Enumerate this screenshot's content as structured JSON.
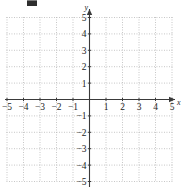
{
  "figure": {
    "kind": "cartesian-coordinate-grid",
    "background_color": "#ffffff",
    "axis_color": "#3a3a3a",
    "grid_color": "#b9b9b9",
    "label_color": "#1d1d1d",
    "artifact": {
      "name": "top-edge-scan-artifact",
      "color": "#2e2e2e"
    }
  },
  "chart_data": {
    "type": "scatter",
    "title": "",
    "subtitle": "",
    "xlabel": "x",
    "ylabel": "y",
    "xlim": [
      -5,
      5
    ],
    "ylim": [
      -5,
      5
    ],
    "grid": true,
    "grid_style": "dotted",
    "legend": "none",
    "series": [],
    "x": [],
    "y": [],
    "x_ticks": [
      -5,
      -4,
      -3,
      -2,
      -1,
      1,
      2,
      3,
      4,
      5
    ],
    "y_ticks": [
      5,
      4,
      3,
      2,
      1,
      -1,
      -2,
      -3,
      -4,
      -5
    ],
    "x_tick_labels": [
      "−5",
      "−4",
      "−3",
      "−2",
      "−1",
      "1",
      "2",
      "3",
      "4",
      "5"
    ],
    "y_tick_labels": [
      "5",
      "4",
      "3",
      "2",
      "1",
      "−1",
      "−2",
      "−3",
      "−4",
      "−5"
    ],
    "annotations": []
  },
  "axes": {
    "x_axis_label": "x",
    "y_axis_label": "y",
    "origin_label": ""
  },
  "x_labels": [
    {
      "value": -5,
      "text": "−5"
    },
    {
      "value": -4,
      "text": "−4"
    },
    {
      "value": -3,
      "text": "−3"
    },
    {
      "value": -2,
      "text": "−2"
    },
    {
      "value": -1,
      "text": "−1"
    },
    {
      "value": 1,
      "text": "1"
    },
    {
      "value": 2,
      "text": "2"
    },
    {
      "value": 3,
      "text": "3"
    },
    {
      "value": 4,
      "text": "4"
    },
    {
      "value": 5,
      "text": "5"
    }
  ],
  "y_labels": [
    {
      "value": 5,
      "text": "5"
    },
    {
      "value": 4,
      "text": "4"
    },
    {
      "value": 3,
      "text": "3"
    },
    {
      "value": 2,
      "text": "2"
    },
    {
      "value": 1,
      "text": "1"
    },
    {
      "value": -1,
      "text": "−1"
    },
    {
      "value": -2,
      "text": "−2"
    },
    {
      "value": -3,
      "text": "−3"
    },
    {
      "value": -4,
      "text": "−4"
    },
    {
      "value": -5,
      "text": "−5"
    }
  ]
}
